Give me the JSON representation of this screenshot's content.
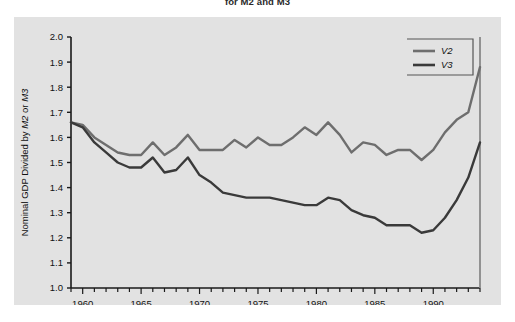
{
  "figure": {
    "title": "for M2 and M3",
    "background_color": "#ffffff",
    "panel_color": "#e2e2e2"
  },
  "chart_data": {
    "type": "line",
    "title": "for M2 and M3",
    "xlabel": "",
    "ylabel": "Nominal GDP Divided by M2 or M3",
    "ylabel_parts": [
      "Nominal GDP Divided by ",
      "M2",
      " or ",
      "M3"
    ],
    "xlim": [
      1959,
      1994
    ],
    "ylim": [
      1.0,
      2.0
    ],
    "ytick_labels": [
      "1.0",
      "1.1",
      "1.2",
      "1.3",
      "1.4",
      "1.5",
      "1.6",
      "1.7",
      "1.8",
      "1.9",
      "2.0"
    ],
    "ytick_values": [
      1.0,
      1.1,
      1.2,
      1.3,
      1.4,
      1.5,
      1.6,
      1.7,
      1.8,
      1.9,
      2.0
    ],
    "xtick_labels": [
      "1960",
      "1965",
      "1970",
      "1975",
      "1980",
      "1985",
      "1990"
    ],
    "xtick_values": [
      1960,
      1965,
      1970,
      1975,
      1980,
      1985,
      1990
    ],
    "xminor_step": 1,
    "grid": false,
    "legend_position": "top-right",
    "x": [
      1959,
      1960,
      1961,
      1962,
      1963,
      1964,
      1965,
      1966,
      1967,
      1968,
      1969,
      1970,
      1971,
      1972,
      1973,
      1974,
      1975,
      1976,
      1977,
      1978,
      1979,
      1980,
      1981,
      1982,
      1983,
      1984,
      1985,
      1986,
      1987,
      1988,
      1989,
      1990,
      1991,
      1992,
      1993,
      1994
    ],
    "series": [
      {
        "name": "V2",
        "color": "#6e6e6e",
        "values": [
          1.66,
          1.65,
          1.6,
          1.57,
          1.54,
          1.53,
          1.53,
          1.58,
          1.53,
          1.56,
          1.61,
          1.55,
          1.55,
          1.55,
          1.59,
          1.56,
          1.6,
          1.57,
          1.57,
          1.6,
          1.64,
          1.61,
          1.66,
          1.61,
          1.54,
          1.58,
          1.57,
          1.53,
          1.55,
          1.55,
          1.51,
          1.55,
          1.62,
          1.67,
          1.7,
          1.88
        ]
      },
      {
        "name": "V3",
        "color": "#3a3a3a",
        "values": [
          1.66,
          1.64,
          1.58,
          1.54,
          1.5,
          1.48,
          1.48,
          1.52,
          1.46,
          1.47,
          1.52,
          1.45,
          1.42,
          1.38,
          1.37,
          1.36,
          1.36,
          1.36,
          1.35,
          1.34,
          1.33,
          1.33,
          1.36,
          1.35,
          1.31,
          1.29,
          1.28,
          1.25,
          1.25,
          1.25,
          1.22,
          1.23,
          1.28,
          1.35,
          1.44,
          1.58
        ]
      }
    ],
    "legend": [
      {
        "label": "V2",
        "color": "#6e6e6e"
      },
      {
        "label": "V3",
        "color": "#3a3a3a"
      }
    ]
  }
}
